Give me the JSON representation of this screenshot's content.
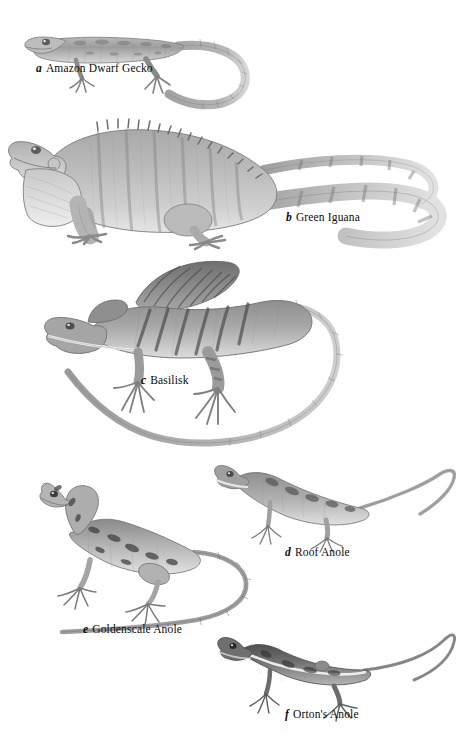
{
  "plate": {
    "kind": "scientific-illustration-plate",
    "background_color": "#ffffff",
    "ink_color": "#6f6f6f",
    "label_color": "#0b0b0b",
    "width": 456,
    "height": 743
  },
  "figures": [
    {
      "key": "a",
      "label": "a",
      "name": "Amazon Dwarf Gecko",
      "caption_x": 36,
      "caption_y": 68,
      "tone": "#9a9a9a",
      "description": "Small slender gecko in left profile, head at left, long tapering tail curving down and to the right"
    },
    {
      "key": "b",
      "label": "b",
      "name": "Green Iguana",
      "caption_x": 286,
      "caption_y": 217,
      "tone": "#8d8d8d",
      "description": "Large iguana in left profile with dewlap, dorsal spine crest, banded body and very long banded tail looping up to the right"
    },
    {
      "key": "c",
      "label": "c",
      "name": "Basilisk",
      "caption_x": 141,
      "caption_y": 380,
      "tone": "#858585",
      "description": "Basilisk with tall dorsal sail crest, head at left, long tail sweeping around in a broad loop to the lower left"
    },
    {
      "key": "d",
      "label": "d",
      "name": "Roof Anole",
      "caption_x": 285,
      "caption_y": 552,
      "tone": "#909090",
      "description": "Small anole, head upper left, body angled down to the right, slim tail arcing up and to the right"
    },
    {
      "key": "e",
      "label": "e",
      "name": "Goldenscale Anole",
      "caption_x": 83,
      "caption_y": 629,
      "tone": "#8a8a8a",
      "description": "Mottled anole with raised head at upper left, splayed limbs, long tail curving right then back to the left"
    },
    {
      "key": "f",
      "label": "f",
      "name": "Orton's Anole",
      "caption_x": 285,
      "caption_y": 714,
      "tone": "#6e6e6e",
      "description": "Dark slender anole, head at left with pale lateral stripe, very long thin tail arcing up and to the right"
    }
  ]
}
